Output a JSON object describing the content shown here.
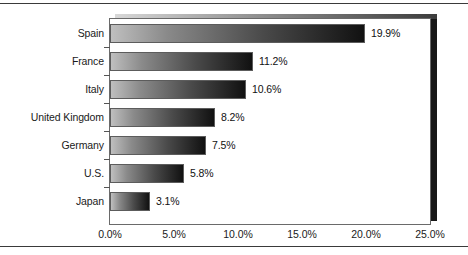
{
  "chart_data": {
    "type": "bar",
    "orientation": "horizontal",
    "title": "",
    "subtitle": "",
    "xlabel": "",
    "ylabel": "",
    "categories": [
      "Spain",
      "France",
      "Italy",
      "United Kingdom",
      "Germany",
      "U.S.",
      "Japan"
    ],
    "values": [
      19.9,
      11.2,
      10.6,
      8.2,
      7.5,
      5.8,
      3.1
    ],
    "value_labels": [
      "19.9%",
      "11.2%",
      "10.6%",
      "8.2%",
      "7.5%",
      "5.8%",
      "3.1%"
    ],
    "series": [
      {
        "name": "",
        "values": [
          19.9,
          11.2,
          10.6,
          8.2,
          7.5,
          5.8,
          3.1
        ]
      }
    ],
    "xlim": [
      0.0,
      25.0
    ],
    "xticks": [
      0.0,
      5.0,
      10.0,
      15.0,
      20.0,
      25.0
    ],
    "xtick_labels": [
      "0.0%",
      "5.0%",
      "10.0%",
      "15.0%",
      "20.0%",
      "25.0%"
    ],
    "grid": false,
    "legend": false,
    "legend_position": "none",
    "bar_fill": "gradient-light-gray-to-black",
    "bar_gradient_start": "#bfbfbf",
    "bar_gradient_end": "#111111",
    "bar_border_color": "#5c5c5c",
    "plot_border_color": "#6a6a6a",
    "plot_shadow_color": "#171717",
    "background": "#ffffff",
    "text_color": "#1a1a1a"
  }
}
